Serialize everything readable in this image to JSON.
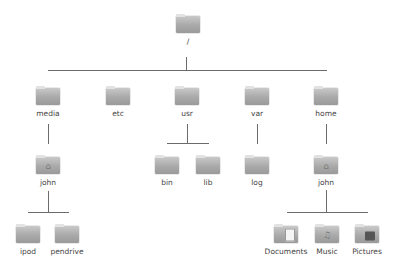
{
  "diagram": {
    "root": {
      "label": "/",
      "icon": "folder-icon"
    },
    "level1": [
      {
        "label": "media",
        "icon": "folder-icon"
      },
      {
        "label": "etc",
        "icon": "folder-icon"
      },
      {
        "label": "usr",
        "icon": "folder-icon"
      },
      {
        "label": "var",
        "icon": "folder-icon"
      },
      {
        "label": "home",
        "icon": "folder-icon"
      }
    ],
    "media_children": [
      {
        "label": "john",
        "icon": "home-folder-icon"
      }
    ],
    "usr_children": [
      {
        "label": "bin",
        "icon": "folder-icon"
      },
      {
        "label": "lib",
        "icon": "folder-icon"
      }
    ],
    "var_children": [
      {
        "label": "log",
        "icon": "folder-icon"
      }
    ],
    "home_children": [
      {
        "label": "john",
        "icon": "home-folder-icon"
      }
    ],
    "media_john_children": [
      {
        "label": "ipod",
        "icon": "folder-icon"
      },
      {
        "label": "pendrive",
        "icon": "folder-icon"
      }
    ],
    "home_john_children": [
      {
        "label": "Documents",
        "icon": "documents-folder-icon"
      },
      {
        "label": "Music",
        "icon": "music-folder-icon"
      },
      {
        "label": "Pictures",
        "icon": "pictures-folder-icon"
      }
    ],
    "colors": {
      "line": "#6b6b6b",
      "folder": "#a9a9a9",
      "text": "#444444"
    }
  }
}
